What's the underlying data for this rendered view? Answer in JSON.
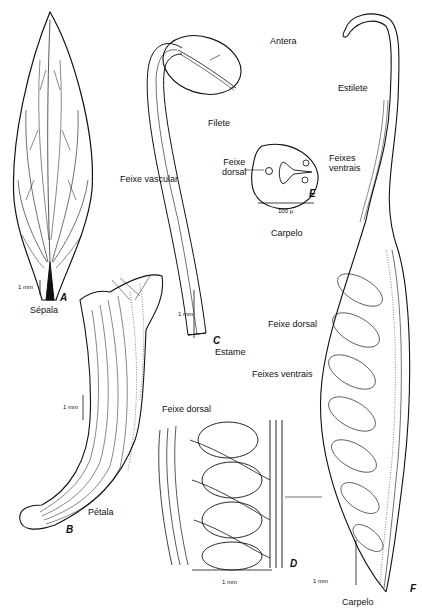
{
  "figure": {
    "panels": {
      "A": {
        "letter": "A",
        "caption": "Sépala",
        "scale": "1 mm"
      },
      "B": {
        "letter": "B",
        "caption": "Pétala",
        "scale": "1 mm"
      },
      "C": {
        "letter": "C",
        "caption": "Estame",
        "scale": "1 mm",
        "labels": {
          "anther": "Antera",
          "filament": "Filete",
          "vascular": "Feixe vascular"
        }
      },
      "D": {
        "letter": "D",
        "scale": "1 mm",
        "labels": {
          "dorsal": "Feixe dorsal"
        }
      },
      "E": {
        "letter": "E",
        "caption": "Carpelo",
        "scale": "100 µ",
        "labels": {
          "dorsal_line1": "Feixe",
          "dorsal_line2": "dorsal",
          "ventral_line1": "Feixes",
          "ventral_line2": "ventrais"
        }
      },
      "F": {
        "letter": "F",
        "caption": "Carpelo",
        "scale": "1 mm",
        "labels": {
          "style": "Estilete",
          "dorsal": "Feixe dorsal",
          "ventral": "Feixes ventrais"
        }
      }
    },
    "colors": {
      "ink": "#111111",
      "paper": "#ffffff"
    }
  }
}
